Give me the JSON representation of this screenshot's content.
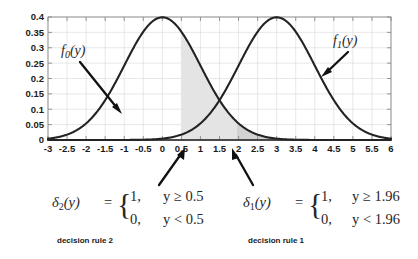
{
  "chart_data": {
    "type": "line",
    "title": "",
    "xlabel": "",
    "ylabel": "",
    "xlim": [
      -3,
      6
    ],
    "ylim": [
      0,
      0.4
    ],
    "grid": true,
    "legend_position": "inline-annotations",
    "xticks": [
      "-3",
      "-2.5",
      "-2",
      "-1.5",
      "-1",
      "-0.5",
      "0",
      "0.5",
      "1",
      "1.5",
      "2",
      "2.5",
      "3",
      "3.5",
      "4",
      "4.5",
      "5",
      "5.5",
      "6"
    ],
    "xtick_values": [
      -3,
      -2.5,
      -2,
      -1.5,
      -1,
      -0.5,
      0,
      0.5,
      1,
      1.5,
      2,
      2.5,
      3,
      3.5,
      4,
      4.5,
      5,
      5.5,
      6
    ],
    "yticks": [
      "0",
      "0.05",
      "0.1",
      "0.15",
      "0.2",
      "0.25",
      "0.3",
      "0.35",
      "0.4"
    ],
    "ytick_values": [
      0,
      0.05,
      0.1,
      0.15,
      0.2,
      0.25,
      0.3,
      0.35,
      0.4
    ],
    "series": [
      {
        "name": "f_0(y)",
        "label": "f",
        "subscript": "0",
        "arg": "(y)",
        "distribution": "normal",
        "mean": 0,
        "sd": 1,
        "peak": 0.4,
        "color": "#232323"
      },
      {
        "name": "f_1(y)",
        "label": "f",
        "subscript": "1",
        "arg": "(y)",
        "distribution": "normal",
        "mean": 3,
        "sd": 1,
        "peak": 0.4,
        "color": "#232323"
      }
    ],
    "shaded_regions": [
      {
        "name": "rejection-region-rule-2",
        "from": 0.5,
        "to": 6,
        "under": "f_0(y)",
        "color": "#e4e4e4"
      },
      {
        "name": "rejection-region-rule-1",
        "from": 1.96,
        "to": 6,
        "under": "f_0(y)",
        "color": "#d2d2d2"
      }
    ],
    "annotations": [
      {
        "name": "f0-callout",
        "text": "f_0(y)",
        "points_to_x": -1.35,
        "points_to_y": 0.12
      },
      {
        "name": "f1-callout",
        "text": "f_1(y)",
        "points_to_x": 4.2,
        "points_to_y": 0.215
      },
      {
        "name": "threshold-0.5-pointer",
        "points_to_x": 0.5,
        "value": "0.5"
      },
      {
        "name": "threshold-1.96-pointer",
        "points_to_x": 1.96,
        "value": "1.96"
      }
    ]
  },
  "curves": {
    "f0": {
      "name_base": "f",
      "sub": "0",
      "arg": "(y)"
    },
    "f1": {
      "name_base": "f",
      "sub": "1",
      "arg": "(y)"
    }
  },
  "rules": {
    "rule2": {
      "symbol_base": "δ",
      "symbol_sub": "2",
      "symbol_arg": "(y)",
      "equals": "=",
      "case_true_value": "1,",
      "case_false_value": "0,",
      "case_true_cond": "y ≥ 0.5",
      "case_false_cond": "y < 0.5",
      "caption": "decision rule 2",
      "threshold": "0.5"
    },
    "rule1": {
      "symbol_base": "δ",
      "symbol_sub": "1",
      "symbol_arg": "(y)",
      "equals": "=",
      "case_true_value": "1,",
      "case_false_value": "0,",
      "case_true_cond": "y ≥ 1.96",
      "case_false_cond": "y < 1.96",
      "caption": "decision rule 1",
      "threshold": "1.96"
    }
  },
  "colors": {
    "curve": "#232323",
    "grid": "#d8d8d8",
    "frame": "#8a8a8a",
    "shade_light": "#e4e4e4",
    "shade_dark": "#d2d2d2",
    "text": "#1a1a1a",
    "background": "#ffffff"
  }
}
